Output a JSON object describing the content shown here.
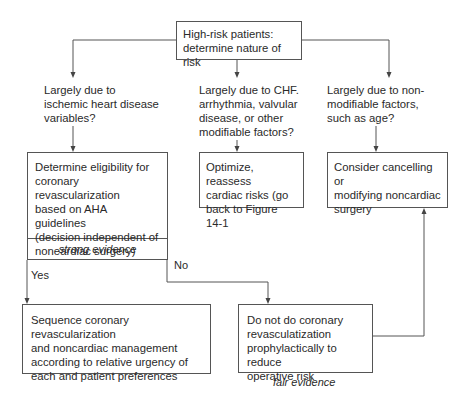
{
  "diagram": {
    "type": "flowchart",
    "nodes": {
      "top": {
        "line1": "High-risk patients:",
        "line2": "determine nature of risk"
      },
      "question_left": {
        "lines": [
          "Largely due to",
          "ischemic heart disease",
          "variables?"
        ]
      },
      "question_middle": {
        "lines": [
          "Largely due to CHF.",
          "arrhythmia, valvular",
          "disease, or other",
          "modifiable factors?"
        ]
      },
      "question_right": {
        "lines": [
          "Largely due to non-",
          "modifiable factors,",
          "such as age?"
        ]
      },
      "eligibility": {
        "lines": [
          "Determine eligibility for",
          "coronary revascularization",
          "based on AHA guidelines",
          "(decision independent of",
          "noneardiac surgery)"
        ],
        "evidence": "strong evidence"
      },
      "optimize": {
        "lines": [
          "Optimize, reassess",
          "cardiac risks (go",
          "back to Figure 14-1"
        ]
      },
      "cancel": {
        "lines": [
          "Consider cancelling or",
          "modifying noncardiac",
          "surgery"
        ]
      },
      "sequence": {
        "lines": [
          "Sequence coronary revascularization",
          "and noncardiac management",
          "according to relative urgency of",
          "each and patient preferences"
        ]
      },
      "do_not": {
        "lines": [
          "Do not do coronary",
          "revasculatization",
          "prophylactically to reduce",
          "operative risk"
        ],
        "evidence": "fair evidence"
      }
    },
    "edge_labels": {
      "yes": "Yes",
      "no": "No"
    },
    "colors": {
      "line": "#555555",
      "text": "#2a2a2a",
      "background": "#ffffff"
    }
  }
}
